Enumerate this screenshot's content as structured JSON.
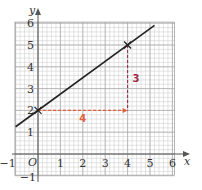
{
  "graph": {
    "x_axis_label": "x",
    "y_axis_label": "y",
    "origin_label": "O",
    "x_ticks": [
      {
        "value": -1,
        "label": "−1"
      },
      {
        "value": 1,
        "label": "1"
      },
      {
        "value": 2,
        "label": "2"
      },
      {
        "value": 3,
        "label": "3"
      },
      {
        "value": 4,
        "label": "4"
      },
      {
        "value": 5,
        "label": "5"
      },
      {
        "value": 6,
        "label": "6"
      }
    ],
    "y_ticks": [
      {
        "value": -1,
        "label": "−1"
      },
      {
        "value": 1,
        "label": "1"
      },
      {
        "value": 2,
        "label": "2"
      },
      {
        "value": 3,
        "label": "3"
      },
      {
        "value": 4,
        "label": "4"
      },
      {
        "value": 5,
        "label": "5"
      },
      {
        "value": 6,
        "label": "6"
      }
    ],
    "x_range": [
      -1,
      6
    ],
    "y_range": [
      -1,
      6
    ],
    "minor_grid_step": 0.2,
    "line": {
      "slope": 0.75,
      "intercept": 2,
      "x_start": -1,
      "x_end": 5.2
    },
    "points": [
      {
        "x": 0,
        "y": 2,
        "marker": "cross"
      },
      {
        "x": 4,
        "y": 5,
        "marker": "cross"
      }
    ],
    "run": {
      "from": [
        0,
        2
      ],
      "to": [
        4,
        2
      ],
      "label": "4"
    },
    "rise": {
      "from": [
        4,
        5
      ],
      "to": [
        4,
        2
      ],
      "label": "3"
    },
    "colors": {
      "grid": "#c8c8c8",
      "axes": "#555555",
      "line": "#222222",
      "run": "#e0603a",
      "rise": "#9a2c45"
    }
  }
}
